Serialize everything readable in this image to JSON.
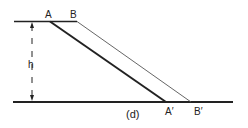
{
  "diagram": {
    "labels": {
      "a": "A",
      "b": "B",
      "a_prime": "A′",
      "b_prime": "B′",
      "height": "h",
      "caption": "(d)"
    },
    "colors": {
      "ink": "#222222",
      "thin": "#555555",
      "background": "#ffffff"
    }
  }
}
